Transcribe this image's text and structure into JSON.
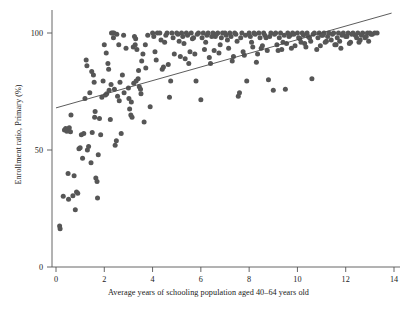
{
  "chart": {
    "type": "scatter",
    "title": "",
    "xlabel": "Average years of schooling population aged 40–64 years old",
    "ylabel": "Enrollment ratio, Primary (%)",
    "x_ticks": [
      "0",
      "2",
      "4",
      "6",
      "8",
      "10",
      "12",
      "14"
    ],
    "y_ticks": [
      "0",
      "50",
      "100"
    ],
    "marker_color": "#565656",
    "trend_color": "#4a4a4a",
    "axis_color": "#555555",
    "background": "#ffffff"
  },
  "chart_data": {
    "type": "scatter",
    "title": "",
    "xlabel": "Average years of schooling population aged 40–64 years old",
    "ylabel": "Enrollment ratio, Primary (%)",
    "xlim": [
      -0.35,
      14.6
    ],
    "ylim": [
      -6,
      112
    ],
    "x_ticks": [
      0,
      2,
      4,
      6,
      8,
      10,
      12,
      14
    ],
    "y_ticks": [
      0,
      50,
      100
    ],
    "grid": false,
    "legend": false,
    "marker_color": "#565656",
    "marker_size": 5,
    "series": [
      {
        "name": "Countries",
        "points": [
          [
            0.15,
            17.5
          ],
          [
            0.17,
            16.3
          ],
          [
            0.3,
            30.2
          ],
          [
            0.35,
            58.5
          ],
          [
            0.4,
            59.2
          ],
          [
            0.45,
            58.0
          ],
          [
            0.5,
            40.0
          ],
          [
            0.52,
            29.0
          ],
          [
            0.55,
            59.5
          ],
          [
            0.6,
            57.8
          ],
          [
            0.62,
            65.0
          ],
          [
            0.7,
            30.5
          ],
          [
            0.75,
            39.0
          ],
          [
            0.8,
            24.5
          ],
          [
            0.85,
            32.0
          ],
          [
            0.9,
            31.5
          ],
          [
            0.95,
            50.5
          ],
          [
            1.0,
            51.0
          ],
          [
            1.05,
            56.5
          ],
          [
            1.1,
            46.5
          ],
          [
            1.15,
            57.0
          ],
          [
            1.2,
            72.0
          ],
          [
            1.25,
            88.5
          ],
          [
            1.3,
            50.0
          ],
          [
            1.35,
            51.5
          ],
          [
            1.4,
            74.5
          ],
          [
            1.45,
            44.5
          ],
          [
            1.5,
            57.5
          ],
          [
            1.55,
            82.0
          ],
          [
            1.6,
            64.0
          ],
          [
            1.62,
            66.5
          ],
          [
            1.65,
            38.0
          ],
          [
            1.7,
            36.5
          ],
          [
            1.72,
            29.5
          ],
          [
            1.75,
            48.0
          ],
          [
            1.8,
            63.5
          ],
          [
            1.85,
            56.5
          ],
          [
            1.9,
            72.5
          ],
          [
            1.95,
            79.5
          ],
          [
            2.0,
            95.0
          ],
          [
            2.05,
            73.5
          ],
          [
            2.1,
            74.0
          ],
          [
            2.15,
            87.0
          ],
          [
            2.2,
            75.5
          ],
          [
            2.25,
            63.0
          ],
          [
            2.3,
            100.0
          ],
          [
            2.35,
            100.0
          ],
          [
            2.4,
            100.0
          ],
          [
            2.45,
            52.0
          ],
          [
            2.5,
            54.0
          ],
          [
            2.55,
            73.0
          ],
          [
            2.6,
            95.0
          ],
          [
            2.65,
            79.0
          ],
          [
            2.7,
            57.0
          ],
          [
            2.75,
            82.0
          ],
          [
            2.8,
            99.0
          ],
          [
            2.9,
            93.5
          ],
          [
            3.0,
            76.5
          ],
          [
            3.05,
            67.5
          ],
          [
            3.1,
            65.0
          ],
          [
            3.15,
            64.0
          ],
          [
            3.2,
            94.0
          ],
          [
            3.25,
            98.5
          ],
          [
            3.3,
            97.5
          ],
          [
            3.35,
            93.0
          ],
          [
            3.4,
            80.5
          ],
          [
            3.45,
            77.0
          ],
          [
            3.5,
            76.0
          ],
          [
            3.55,
            88.0
          ],
          [
            3.6,
            91.0
          ],
          [
            3.65,
            62.0
          ],
          [
            3.7,
            95.0
          ],
          [
            3.8,
            99.0
          ],
          [
            3.9,
            68.5
          ],
          [
            4.0,
            100.0
          ],
          [
            4.1,
            92.0
          ],
          [
            4.2,
            100.0
          ],
          [
            4.3,
            100.0
          ],
          [
            4.4,
            84.5
          ],
          [
            4.5,
            96.0
          ],
          [
            4.6,
            100.0
          ],
          [
            4.7,
            72.5
          ],
          [
            4.75,
            79.5
          ],
          [
            4.8,
            100.0
          ],
          [
            4.9,
            91.0
          ],
          [
            5.0,
            100.0
          ],
          [
            5.1,
            96.5
          ],
          [
            5.2,
            100.0
          ],
          [
            5.3,
            95.5
          ],
          [
            5.4,
            100.0
          ],
          [
            5.5,
            87.0
          ],
          [
            5.6,
            100.0
          ],
          [
            5.7,
            98.0
          ],
          [
            5.8,
            79.5
          ],
          [
            5.9,
            100.0
          ],
          [
            6.0,
            71.5
          ],
          [
            6.1,
            100.0
          ],
          [
            6.2,
            96.0
          ],
          [
            6.3,
            100.0
          ],
          [
            6.4,
            87.0
          ],
          [
            6.5,
            100.0
          ],
          [
            6.6,
            98.5
          ],
          [
            6.7,
            100.0
          ],
          [
            6.8,
            95.0
          ],
          [
            6.9,
            100.0
          ],
          [
            7.0,
            100.0
          ],
          [
            7.1,
            97.0
          ],
          [
            7.2,
            100.0
          ],
          [
            7.3,
            88.0
          ],
          [
            7.4,
            100.0
          ],
          [
            7.5,
            96.5
          ],
          [
            7.55,
            73.0
          ],
          [
            7.6,
            74.5
          ],
          [
            7.7,
            100.0
          ],
          [
            7.8,
            90.5
          ],
          [
            7.9,
            79.5
          ],
          [
            8.0,
            100.0
          ],
          [
            8.1,
            96.0
          ],
          [
            8.2,
            100.0
          ],
          [
            8.3,
            87.5
          ],
          [
            8.4,
            100.0
          ],
          [
            8.5,
            93.5
          ],
          [
            8.6,
            100.0
          ],
          [
            8.7,
            98.0
          ],
          [
            8.8,
            80.0
          ],
          [
            8.9,
            100.0
          ],
          [
            9.0,
            75.5
          ],
          [
            9.1,
            100.0
          ],
          [
            9.2,
            92.5
          ],
          [
            9.3,
            100.0
          ],
          [
            9.4,
            96.0
          ],
          [
            9.5,
            76.0
          ],
          [
            9.6,
            100.0
          ],
          [
            9.7,
            99.0
          ],
          [
            9.8,
            100.0
          ],
          [
            9.9,
            94.5
          ],
          [
            10.0,
            100.0
          ],
          [
            10.1,
            97.5
          ],
          [
            10.2,
            100.0
          ],
          [
            10.3,
            95.5
          ],
          [
            10.4,
            100.0
          ],
          [
            10.5,
            98.0
          ],
          [
            10.6,
            80.5
          ],
          [
            10.7,
            100.0
          ],
          [
            10.8,
            93.0
          ],
          [
            10.9,
            100.0
          ],
          [
            11.0,
            99.0
          ],
          [
            11.1,
            100.0
          ],
          [
            11.2,
            96.5
          ],
          [
            11.3,
            100.0
          ],
          [
            11.4,
            97.0
          ],
          [
            11.5,
            100.0
          ],
          [
            11.6,
            95.0
          ],
          [
            11.7,
            100.0
          ],
          [
            11.8,
            93.5
          ],
          [
            11.9,
            100.0
          ],
          [
            12.0,
            98.5
          ],
          [
            12.1,
            100.0
          ],
          [
            12.2,
            96.0
          ],
          [
            12.3,
            100.0
          ],
          [
            12.4,
            99.0
          ],
          [
            12.5,
            100.0
          ],
          [
            12.6,
            97.0
          ],
          [
            12.7,
            100.0
          ],
          [
            12.8,
            98.0
          ],
          [
            12.9,
            100.0
          ],
          [
            13.0,
            100.0
          ],
          [
            13.1,
            99.5
          ],
          [
            13.2,
            100.0
          ],
          [
            13.3,
            100.0
          ],
          [
            2.38,
            98.0
          ],
          [
            2.52,
            99.5
          ],
          [
            3.28,
            95.0
          ],
          [
            3.42,
            84.0
          ],
          [
            4.05,
            98.5
          ],
          [
            4.35,
            97.0
          ],
          [
            4.55,
            99.0
          ],
          [
            4.85,
            98.0
          ],
          [
            5.05,
            99.5
          ],
          [
            5.25,
            98.5
          ],
          [
            5.45,
            99.0
          ],
          [
            5.65,
            97.5
          ],
          [
            5.85,
            99.5
          ],
          [
            6.05,
            98.0
          ],
          [
            6.25,
            99.0
          ],
          [
            6.45,
            98.5
          ],
          [
            6.65,
            99.5
          ],
          [
            6.85,
            98.0
          ],
          [
            7.05,
            99.0
          ],
          [
            7.25,
            98.5
          ],
          [
            7.45,
            99.5
          ],
          [
            7.65,
            98.0
          ],
          [
            7.85,
            99.0
          ],
          [
            8.05,
            98.5
          ],
          [
            8.25,
            99.5
          ],
          [
            8.45,
            98.0
          ],
          [
            8.65,
            99.0
          ],
          [
            8.85,
            98.5
          ],
          [
            9.05,
            99.5
          ],
          [
            9.25,
            98.0
          ],
          [
            9.45,
            99.0
          ],
          [
            9.65,
            98.5
          ],
          [
            9.85,
            99.5
          ],
          [
            10.05,
            98.0
          ],
          [
            10.25,
            99.0
          ],
          [
            10.45,
            98.5
          ],
          [
            10.65,
            99.5
          ],
          [
            10.85,
            98.0
          ],
          [
            11.05,
            99.0
          ],
          [
            11.25,
            98.5
          ],
          [
            11.45,
            99.5
          ],
          [
            11.65,
            98.0
          ],
          [
            11.85,
            99.0
          ],
          [
            12.05,
            98.5
          ],
          [
            12.25,
            99.5
          ],
          [
            12.45,
            98.0
          ],
          [
            12.65,
            99.0
          ],
          [
            12.85,
            98.5
          ],
          [
            13.05,
            99.5
          ],
          [
            1.28,
            86.0
          ],
          [
            1.48,
            83.5
          ],
          [
            1.58,
            79.0
          ],
          [
            2.08,
            91.5
          ],
          [
            2.18,
            84.5
          ],
          [
            2.28,
            78.0
          ],
          [
            2.42,
            76.0
          ],
          [
            2.62,
            71.0
          ],
          [
            2.82,
            74.5
          ],
          [
            3.02,
            72.0
          ],
          [
            3.12,
            70.5
          ],
          [
            3.22,
            78.5
          ],
          [
            3.32,
            79.5
          ],
          [
            3.52,
            74.0
          ],
          [
            3.72,
            85.0
          ],
          [
            4.15,
            88.5
          ],
          [
            4.45,
            85.5
          ],
          [
            4.65,
            86.5
          ],
          [
            5.15,
            90.0
          ],
          [
            5.35,
            89.0
          ],
          [
            5.55,
            92.0
          ],
          [
            5.75,
            91.0
          ],
          [
            6.15,
            93.0
          ],
          [
            6.35,
            89.5
          ],
          [
            6.55,
            92.5
          ],
          [
            6.75,
            91.5
          ],
          [
            7.15,
            93.5
          ],
          [
            7.35,
            90.0
          ],
          [
            7.75,
            92.0
          ],
          [
            8.15,
            94.0
          ],
          [
            8.35,
            91.0
          ],
          [
            8.55,
            94.5
          ],
          [
            8.75,
            92.5
          ],
          [
            9.15,
            95.0
          ],
          [
            9.35,
            93.0
          ],
          [
            9.55,
            95.5
          ],
          [
            9.75,
            93.5
          ],
          [
            10.15,
            96.0
          ],
          [
            10.35,
            94.0
          ],
          [
            10.55,
            96.5
          ],
          [
            10.95,
            94.5
          ],
          [
            11.15,
            96.0
          ],
          [
            11.55,
            95.0
          ],
          [
            11.75,
            96.5
          ],
          [
            12.15,
            95.5
          ],
          [
            12.55,
            96.0
          ],
          [
            12.95,
            96.5
          ]
        ]
      }
    ],
    "trendline": {
      "type": "linear",
      "x0": 0.0,
      "y0": 68.0,
      "x1": 13.9,
      "y1": 108.5,
      "description": "fitted regression line"
    }
  }
}
